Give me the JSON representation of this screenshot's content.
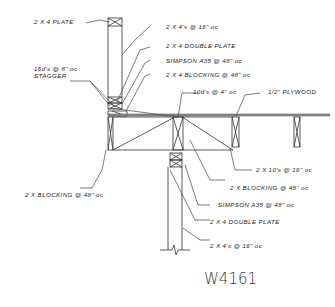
{
  "drawing": {
    "id": "W4161",
    "labels": {
      "top_plate": "2 X 4 PLATE",
      "studs_upper": "2 X 4's @ 16\" oc",
      "double_plate_upper": "2 X 4 DOUBLE PLATE",
      "simpson_upper": "SIMPSON A35 @ 48\" oc",
      "blocking_upper": "2 X 4 BLOCKING @ 48\" oc",
      "nails_stagger_line1": "16d's @ 8\" oc",
      "nails_stagger_line2": "STAGGER",
      "nails_10d": "10d's @ 4\" oc",
      "plywood": "1/2\" PLYWOOD",
      "joists": "2 X 10's @ 16\" oc",
      "blocking_right": "2 X BLOCKING @ 48\" oc",
      "blocking_left": "2 X BLOCKING @ 48\" oc",
      "simpson_lower": "SIMPSON A35 @ 48\" oc",
      "double_plate_lower": "2 X 4 DOUBLE PLATE",
      "studs_lower": "2 X 4's @ 16\" oc"
    }
  }
}
